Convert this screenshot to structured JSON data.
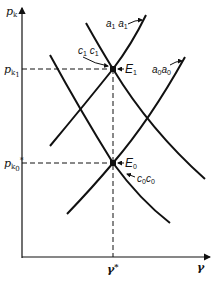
{
  "diagram": {
    "y_axis": {
      "label": "p",
      "label_sub": "k"
    },
    "x_axis": {
      "label": "γ"
    },
    "ticks": {
      "y_high": {
        "label": "p",
        "label_sub": "k",
        "label_sub2": "1"
      },
      "y_low": {
        "label": "p",
        "label_sub": "k",
        "label_sub2": "0",
        "sup": "*"
      },
      "x_star": {
        "label": "γ",
        "sup": "*"
      }
    },
    "points": {
      "E1": {
        "label": "E",
        "sub": "1"
      },
      "E0": {
        "label": "E",
        "sub": "0"
      }
    },
    "curves": {
      "a1": {
        "label": "a",
        "sub": "1",
        "label2": "a",
        "sub2": "1"
      },
      "a0": {
        "label": "a",
        "sub": "0",
        "label2": "a",
        "sub2": "0"
      },
      "c1": {
        "label": "c",
        "sub": "1",
        "label2": "c",
        "sub2": "1"
      },
      "c0": {
        "label": "c",
        "sub": "0",
        "label2": "c",
        "sub2": "0"
      }
    },
    "colors": {
      "line": "#111111",
      "background": "#ffffff"
    }
  }
}
